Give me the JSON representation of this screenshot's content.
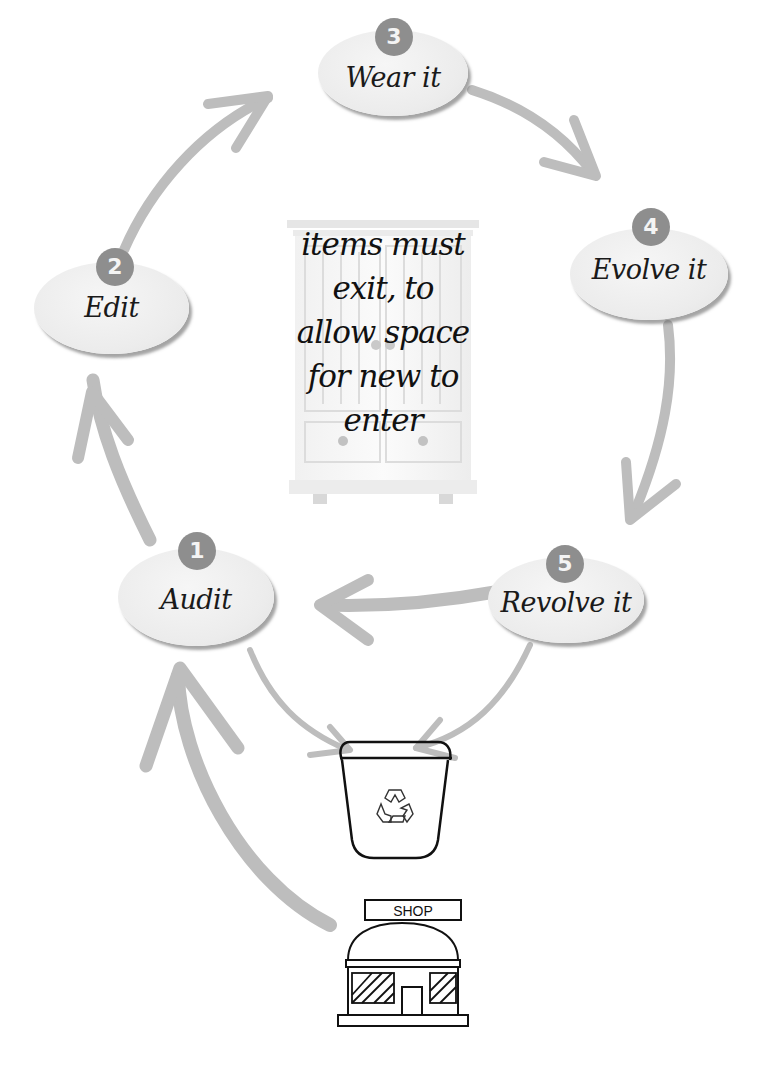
{
  "diagram": {
    "type": "cycle",
    "center_text": {
      "lines": [
        "items must",
        "exit, to",
        "allow space",
        "for new to",
        "enter"
      ]
    },
    "nodes": [
      {
        "number": "1",
        "label": "Audit"
      },
      {
        "number": "2",
        "label": "Edit"
      },
      {
        "number": "3",
        "label": "Wear it"
      },
      {
        "number": "4",
        "label": "Evolve it"
      },
      {
        "number": "5",
        "label": "Revolve it"
      }
    ],
    "icons": {
      "center": "wardrobe-cabinet-icon",
      "bin": "recycle-bin-icon",
      "store": "shop-icon"
    },
    "shop_sign": "SHOP",
    "colors": {
      "arrow": "#bdbdbd",
      "badge": "#8e8e8e",
      "node_fill": "#ececec",
      "outline": "#111111"
    },
    "flows": [
      {
        "from": "1",
        "to": "2"
      },
      {
        "from": "2",
        "to": "3"
      },
      {
        "from": "3",
        "to": "4"
      },
      {
        "from": "4",
        "to": "5"
      },
      {
        "from": "5",
        "to": "1"
      },
      {
        "from": "1",
        "to": "bin"
      },
      {
        "from": "5",
        "to": "bin"
      },
      {
        "from": "shop",
        "to": "1"
      }
    ]
  }
}
